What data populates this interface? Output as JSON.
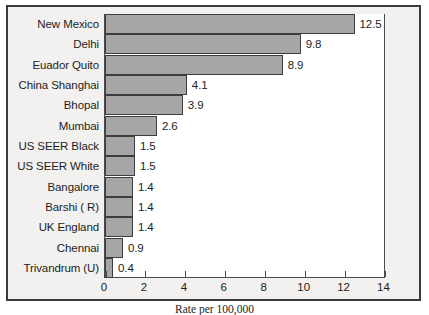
{
  "chart_data": {
    "type": "bar",
    "orientation": "horizontal",
    "title": "",
    "xlabel": "Rate per 100,000",
    "ylabel": "",
    "xlim": [
      0,
      14
    ],
    "xticks": [
      0,
      2,
      4,
      6,
      8,
      10,
      12,
      14
    ],
    "xtick_labels": [
      "0",
      "2",
      "4",
      "6",
      "8",
      "10",
      "12",
      "14"
    ],
    "grid": false,
    "legend": false,
    "categories": [
      "New Mexico",
      "Delhi",
      "Euador Quito",
      "China Shanghai",
      "Bhopal",
      "Mumbai",
      "US SEER Black",
      "US SEER White",
      "Bangalore",
      "Barshi ( R)",
      "UK England",
      "Chennai",
      "Trivandrum (U)"
    ],
    "values": [
      12.5,
      9.8,
      8.9,
      4.1,
      3.9,
      2.6,
      1.5,
      1.5,
      1.4,
      1.4,
      1.4,
      0.9,
      0.4
    ],
    "value_labels": [
      "12.5",
      "9.8",
      "8.9",
      "4.1",
      "3.9",
      "2.6",
      "1.5",
      "1.5",
      "1.4",
      "1.4",
      "1.4",
      "0.9",
      "0.4"
    ],
    "colors": {
      "bar_fill": "#a6a6a6",
      "bar_edge": "#3d3d3d",
      "plot_background": "#ffffff",
      "figure_background": "#f2f1ef",
      "frame": "#3a3a3a",
      "axis": "#4a4a4a",
      "text": "#1d1d1d"
    }
  }
}
